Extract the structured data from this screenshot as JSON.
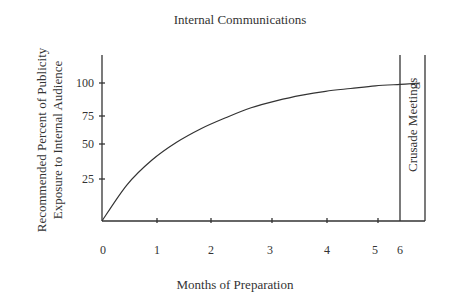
{
  "chart_data": {
    "type": "line",
    "title": "Internal Communications",
    "xlabel": "Months of Preparation",
    "ylabel_line1": "Recommended Percent of Publicity",
    "ylabel_line2": "Exposure to Internal Audience",
    "x_ticks": [
      "0",
      "1",
      "2",
      "3",
      "4",
      "5",
      "6"
    ],
    "y_ticks": [
      "25",
      "50",
      "75",
      "100"
    ],
    "series": [
      {
        "name": "Publicity exposure",
        "x": [
          0,
          0.5,
          1,
          1.5,
          2,
          2.5,
          3,
          3.5,
          4,
          4.5,
          5,
          5.5,
          6,
          6.4
        ],
        "values": [
          0,
          26,
          44,
          57,
          67,
          75,
          82,
          87,
          91,
          94,
          96,
          98,
          99,
          100
        ]
      }
    ],
    "annotation": {
      "label": "Crusade Meetings",
      "x_start": 6,
      "x_end": 6.4
    },
    "xlim": [
      0,
      6.4
    ],
    "ylim": [
      0,
      120
    ],
    "grid": false,
    "legend": "none"
  },
  "colors": {
    "line": "#333333",
    "text": "#333333",
    "background": "#ffffff"
  }
}
